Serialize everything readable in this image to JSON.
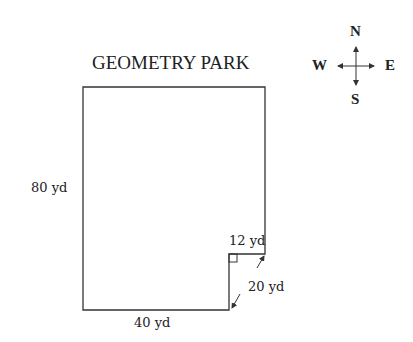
{
  "diagram": {
    "title": "GEOMETRY PARK",
    "labels": {
      "left_side": "80 yd",
      "bottom_side": "40 yd",
      "notch_top": "12 yd",
      "notch_side": "20 yd"
    },
    "compass": {
      "north": "N",
      "south": "S",
      "east": "E",
      "west": "W"
    },
    "shape": {
      "type": "rectangle-with-notch",
      "stroke_color": "#333333"
    }
  }
}
